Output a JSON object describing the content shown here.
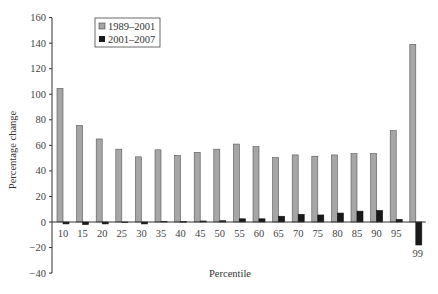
{
  "chart_data": {
    "type": "bar",
    "title": "",
    "xlabel": "Percentile",
    "ylabel": "Percentage change",
    "ylim": [
      -40,
      160
    ],
    "yticks": [
      -40,
      -20,
      0,
      20,
      40,
      60,
      80,
      100,
      120,
      140,
      160
    ],
    "grid": false,
    "legend_position": "top-left-inside",
    "categories": [
      "10",
      "15",
      "20",
      "25",
      "30",
      "35",
      "40",
      "45",
      "50",
      "55",
      "60",
      "65",
      "70",
      "75",
      "80",
      "85",
      "90",
      "95",
      "99"
    ],
    "series": [
      {
        "name": "1989–2001",
        "color": "#a6a6a6",
        "values": [
          104.5,
          75.5,
          65,
          57,
          51,
          56.5,
          52,
          54.5,
          57,
          61,
          59,
          50.5,
          52.5,
          51.5,
          52.5,
          53.5,
          53.5,
          71.5,
          139
        ]
      },
      {
        "name": "2001–2007",
        "color": "#1a1a1a",
        "values": [
          -1.5,
          -2,
          -1.5,
          0,
          -1.5,
          0.5,
          0.3,
          0.8,
          1,
          2.5,
          2.5,
          4.5,
          6,
          5.5,
          7,
          8.5,
          9,
          2,
          -18
        ]
      }
    ]
  }
}
